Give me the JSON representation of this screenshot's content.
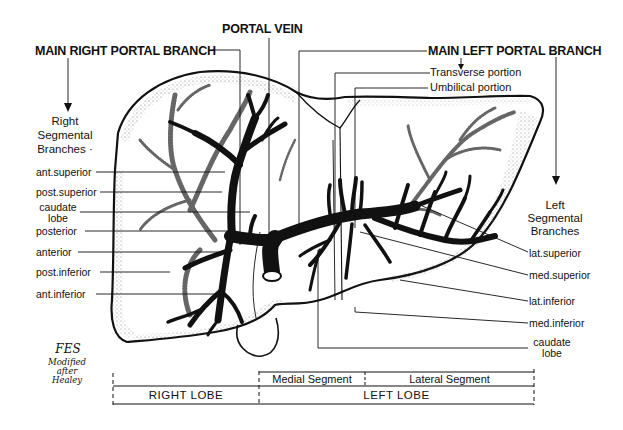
{
  "diagram": {
    "title_labels": {
      "portal_vein": "PORTAL VEIN",
      "main_right_portal_branch": "MAIN RIGHT PORTAL BRANCH",
      "main_left_portal_branch": "MAIN LEFT PORTAL BRANCH"
    },
    "left_portion_labels": {
      "transverse": "Transverse portion",
      "umbilical": "Umbilical portion"
    },
    "right_group": {
      "heading_lines": [
        "Right",
        "Segmental",
        "Branches ·"
      ],
      "branches": [
        {
          "label": "ant.superior"
        },
        {
          "label": "post.superior"
        },
        {
          "label_lines": [
            "caudate",
            "lobe"
          ]
        },
        {
          "label": "posterior"
        },
        {
          "label": "anterior"
        },
        {
          "label": "post.inferior"
        },
        {
          "label": "ant.inferior"
        }
      ]
    },
    "left_group": {
      "heading_lines": [
        "Left",
        "Segmental",
        "Branches"
      ],
      "branches": [
        {
          "label": "lat.superior"
        },
        {
          "label": "med.superior"
        },
        {
          "label": "lat.inferior"
        },
        {
          "label": "med.inferior"
        },
        {
          "label_lines": [
            "caudate",
            "lobe"
          ]
        }
      ]
    },
    "signature": {
      "initials": "FES",
      "credit_lines": [
        "Modified",
        "after",
        "Healey"
      ]
    },
    "lobe_scale": {
      "segments": [
        "Medial Segment",
        "Lateral Segment"
      ],
      "lobes": [
        "RIGHT LOBE",
        "LEFT LOBE"
      ]
    },
    "colors": {
      "ink": "#111111",
      "background": "#ffffff",
      "stipple": "#555555"
    }
  }
}
